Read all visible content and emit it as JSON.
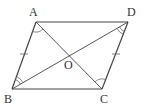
{
  "diagram": {
    "type": "parallelogram",
    "points": {
      "A": {
        "label": "A",
        "x": 36,
        "y": 22,
        "lx": 29,
        "ly": 16
      },
      "B": {
        "label": "B",
        "x": 12,
        "y": 89,
        "lx": 4,
        "ly": 103
      },
      "C": {
        "label": "C",
        "x": 102,
        "y": 89,
        "lx": 100,
        "ly": 103
      },
      "D": {
        "label": "D",
        "x": 128,
        "y": 22,
        "lx": 127,
        "ly": 16
      },
      "O": {
        "label": "O",
        "x": 70,
        "y": 55,
        "lx": 64,
        "ly": 69
      }
    },
    "edges": [
      "AB",
      "BC",
      "CD",
      "DA",
      "AC",
      "BD"
    ],
    "tick_marks": [
      "AB",
      "DC"
    ],
    "angle_marks": [
      "BAC",
      "DCA",
      "ABD",
      "BDC"
    ],
    "colors": {
      "stroke": "#444444",
      "mark": "#666666"
    }
  }
}
